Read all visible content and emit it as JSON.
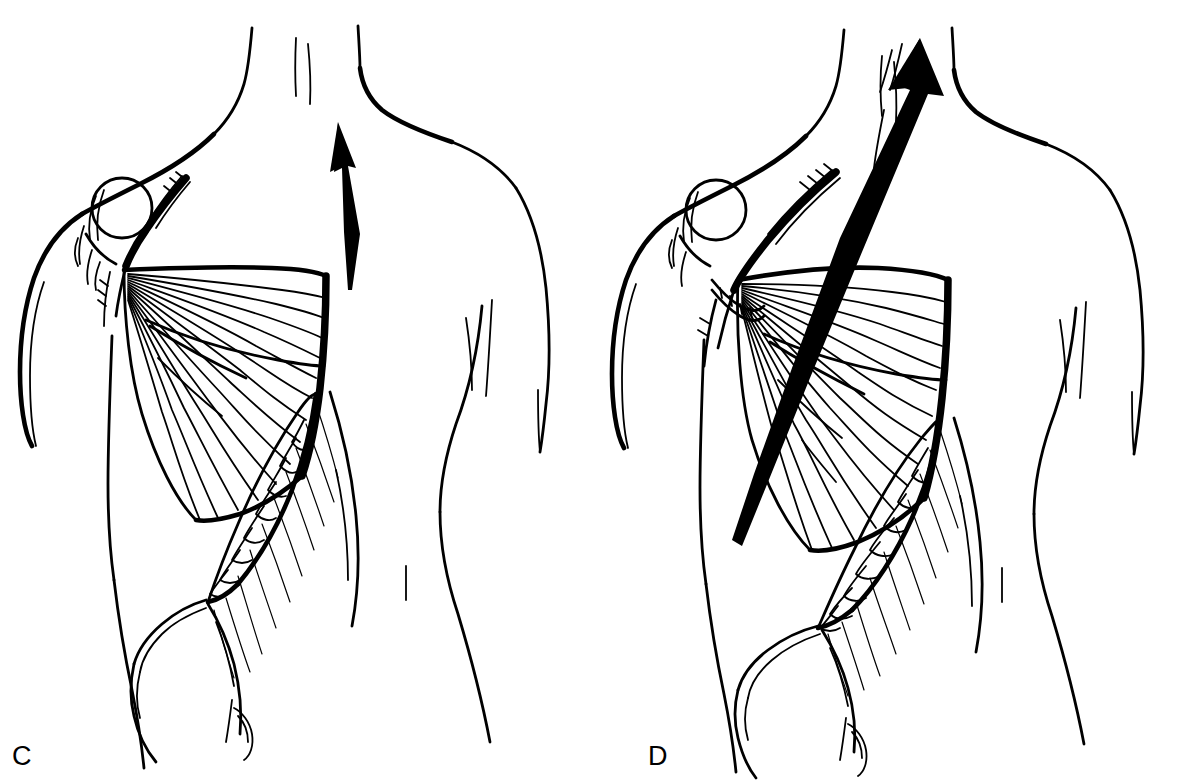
{
  "figure": {
    "kind": "line-drawing",
    "background_color": "#ffffff",
    "ink_color": "#000000",
    "panel_count": 2
  },
  "panels": [
    {
      "id": "C",
      "label": "C",
      "caption_letter": "C",
      "description": "Posterior torso with latissimus dorsi flap elevated and fanned laterally; single slender arrow directed superiorly along the midline",
      "arrow": {
        "name": "rotation-arrow",
        "direction": "up",
        "style": "slender-tapered",
        "length_px": 170
      },
      "structures": [
        "torso-outline",
        "neck-and-shoulders",
        "left-arm",
        "right-arm",
        "humeral-head",
        "latissimus-dorsi-flap",
        "muscle-fiber-fan",
        "tendon-band",
        "external-oblique-digitations",
        "iliac-crest",
        "gluteal-contour",
        "spine-marks"
      ]
    },
    {
      "id": "D",
      "label": "D",
      "caption_letter": "D",
      "description": "Posterior torso with latissimus dorsi flap rotated further superiorly; bold long arrow sweeping up past the shoulder",
      "arrow": {
        "name": "rotation-arrow",
        "direction": "up",
        "style": "bold-long-tapered",
        "length_px": 300
      },
      "structures": [
        "torso-outline",
        "neck-and-shoulders",
        "left-arm",
        "right-arm",
        "humeral-head",
        "retractor-hook",
        "latissimus-dorsi-flap",
        "muscle-fiber-fan",
        "tendon-band",
        "external-oblique-digitations",
        "iliac-crest",
        "gluteal-contour",
        "spine-marks"
      ]
    }
  ]
}
